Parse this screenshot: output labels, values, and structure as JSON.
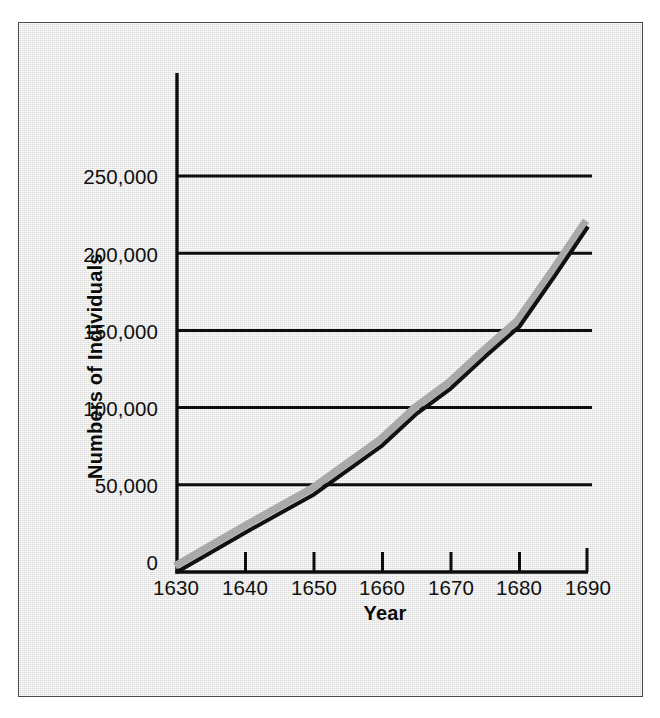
{
  "figure": {
    "background_color": "#ebebeb",
    "frame_color": "#4a4a4a",
    "ink_color": "#111111",
    "shadow_color": "#a9a9a9"
  },
  "chart_data": {
    "type": "line",
    "title": "",
    "subtitle": "",
    "xlabel": "Year",
    "ylabel": "Numbers of Individuals",
    "xlim": [
      1630,
      1690
    ],
    "ylim": [
      0,
      250000
    ],
    "xticks": [
      1630,
      1640,
      1650,
      1660,
      1670,
      1680,
      1690
    ],
    "xtick_labels": [
      "1630",
      "1640",
      "1650",
      "1660",
      "1670",
      "1680",
      "1690"
    ],
    "yticks": [
      0,
      50000,
      100000,
      150000,
      200000,
      250000
    ],
    "ytick_labels": [
      "0",
      "50,000",
      "100,000",
      "150,000",
      "200,000",
      "250,000"
    ],
    "grid": "horizontal",
    "gridlines_at": [
      50000,
      100000,
      150000,
      200000,
      250000
    ],
    "legend": "none",
    "annotations": [],
    "series": [
      {
        "name": "Population",
        "style": "solid-black-with-gray-offset-shadow",
        "x": [
          1630,
          1640,
          1650,
          1660,
          1665,
          1670,
          1675,
          1680,
          1685,
          1690
        ],
        "values": [
          0,
          25000,
          49000,
          80000,
          100000,
          116000,
          136000,
          155000,
          186000,
          218000
        ]
      }
    ]
  }
}
